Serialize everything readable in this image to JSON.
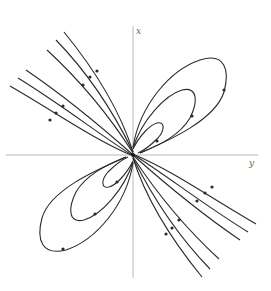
{
  "figure": {
    "type": "phase-portrait",
    "axes": {
      "vertical_label": "x",
      "horizontal_label": "y"
    }
  }
}
